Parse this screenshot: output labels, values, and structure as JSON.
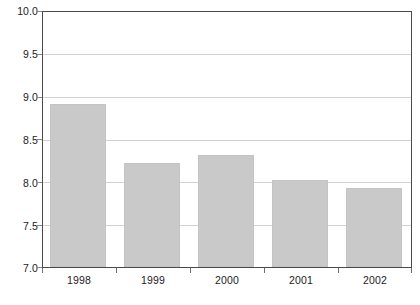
{
  "chart_data": {
    "type": "bar",
    "title": "",
    "subtitle": "",
    "xlabel": "",
    "ylabel": "",
    "categories": [
      "1998",
      "1999",
      "2000",
      "2002_placeholder",
      "2002"
    ],
    "x_tick_labels": [
      "1998",
      "1999",
      "2000",
      "2001",
      "2002"
    ],
    "values": [
      8.92,
      8.22,
      8.32,
      8.02,
      7.93
    ],
    "series": [
      {
        "name": "",
        "values": [
          8.92,
          8.22,
          8.32,
          8.02,
          7.93
        ]
      }
    ],
    "ylim": [
      7.0,
      10.0
    ],
    "y_tick_labels": [
      "10.0",
      "9.5",
      "9.0",
      "8.5",
      "8.0",
      "7.5",
      "7.0"
    ],
    "y_tick_values": [
      10.0,
      9.5,
      9.0,
      8.5,
      8.0,
      7.5,
      7.0
    ],
    "grid": true,
    "legend": "none",
    "colors": {
      "bar_fill": "#c9c9c9",
      "bar_border": "#c4c4c4",
      "gridline": "#d2d2d2",
      "frame": "#4a4a4a",
      "text": "#1c1c1c",
      "background": "#ffffff"
    }
  }
}
